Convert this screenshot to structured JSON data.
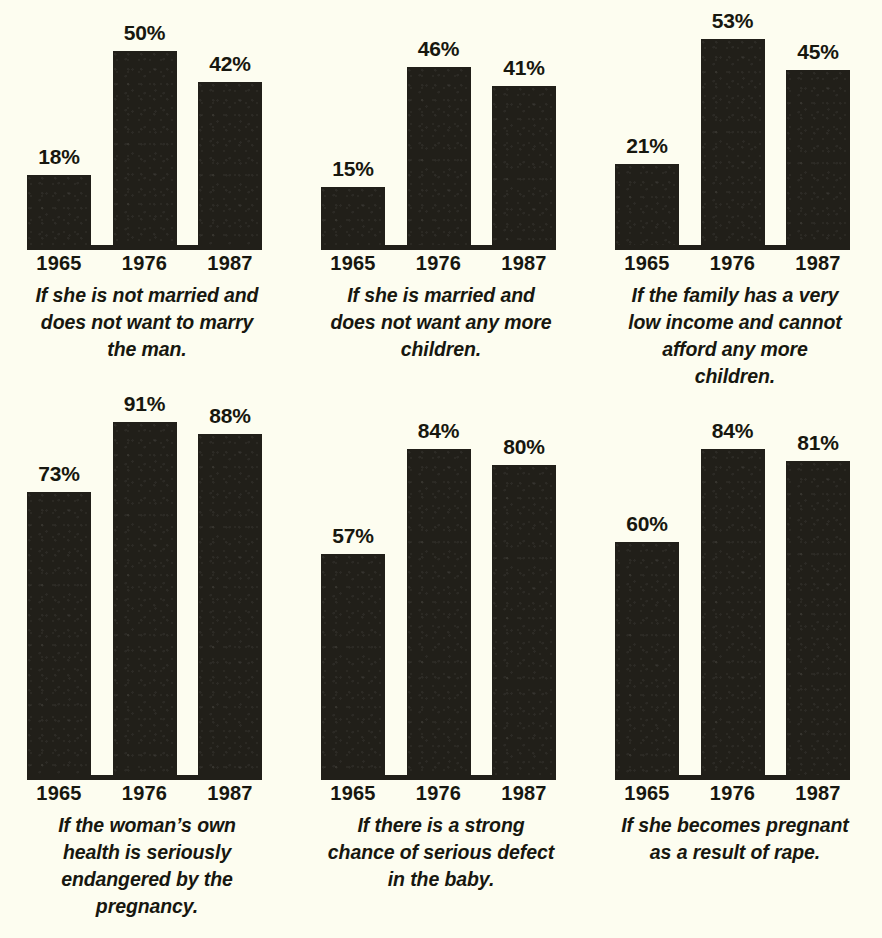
{
  "figure": {
    "background_color": "#fdfdf0",
    "bar_color": "#211f19",
    "text_color": "#17170f",
    "rows": 2,
    "columns": 3
  },
  "chart_data": [
    {
      "type": "bar",
      "title": "If she is not married and does not want to marry the man.",
      "caption_lines": [
        "If she is not married and",
        "does not want to marry",
        "the man."
      ],
      "categories": [
        "1965",
        "1976",
        "1987"
      ],
      "values": [
        18,
        50,
        42
      ],
      "value_labels": [
        "18%",
        "50%",
        "42%"
      ],
      "xlabel": "",
      "ylabel": "",
      "ylim": [
        0,
        100
      ],
      "grid": false,
      "legend": "none"
    },
    {
      "type": "bar",
      "title": "If she is married and does not want any more children.",
      "caption_lines": [
        "If she is married and",
        "does not want any more",
        "children."
      ],
      "categories": [
        "1965",
        "1976",
        "1987"
      ],
      "values": [
        15,
        46,
        41
      ],
      "value_labels": [
        "15%",
        "46%",
        "41%"
      ],
      "xlabel": "",
      "ylabel": "",
      "ylim": [
        0,
        100
      ],
      "grid": false,
      "legend": "none"
    },
    {
      "type": "bar",
      "title": "If the family has a very low income and cannot afford any more children.",
      "caption_lines": [
        "If the family has a very",
        "low income and cannot",
        "afford any more",
        "children."
      ],
      "categories": [
        "1965",
        "1976",
        "1987"
      ],
      "values": [
        21,
        53,
        45
      ],
      "value_labels": [
        "21%",
        "53%",
        "45%"
      ],
      "xlabel": "",
      "ylabel": "",
      "ylim": [
        0,
        100
      ],
      "grid": false,
      "legend": "none"
    },
    {
      "type": "bar",
      "title": "If the woman’s own health is seriously endangered by the pregnancy.",
      "caption_lines": [
        "If the woman’s own",
        "health is seriously",
        "endangered by the",
        "pregnancy."
      ],
      "categories": [
        "1965",
        "1976",
        "1987"
      ],
      "values": [
        73,
        91,
        88
      ],
      "value_labels": [
        "73%",
        "91%",
        "88%"
      ],
      "xlabel": "",
      "ylabel": "",
      "ylim": [
        0,
        100
      ],
      "grid": false,
      "legend": "none"
    },
    {
      "type": "bar",
      "title": "If there is a strong chance of serious defect in the baby.",
      "caption_lines": [
        "If there is a strong",
        "chance of serious defect",
        "in the baby."
      ],
      "categories": [
        "1965",
        "1976",
        "1987"
      ],
      "values": [
        57,
        84,
        80
      ],
      "value_labels": [
        "57%",
        "84%",
        "80%"
      ],
      "xlabel": "",
      "ylabel": "",
      "ylim": [
        0,
        100
      ],
      "grid": false,
      "legend": "none"
    },
    {
      "type": "bar",
      "title": "If she becomes pregnant as a result of rape.",
      "caption_lines": [
        "If she becomes pregnant",
        "as a result of rape."
      ],
      "categories": [
        "1965",
        "1976",
        "1987"
      ],
      "values": [
        60,
        84,
        81
      ],
      "value_labels": [
        "60%",
        "84%",
        "81%"
      ],
      "xlabel": "",
      "ylabel": "",
      "ylim": [
        0,
        100
      ],
      "grid": false,
      "legend": "none"
    }
  ]
}
